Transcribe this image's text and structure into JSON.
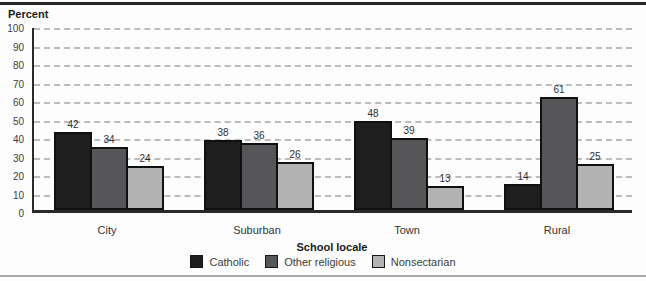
{
  "figure": {
    "y_axis_title": "Percent",
    "x_axis_title": "School locale"
  },
  "chart_data": {
    "type": "bar",
    "title": "",
    "ylabel": "Percent",
    "xlabel": "School locale",
    "categories": [
      "City",
      "Suburban",
      "Town",
      "Rural"
    ],
    "series": [
      {
        "name": "Catholic",
        "color": "#1e1e1e",
        "values": [
          42,
          38,
          48,
          14
        ]
      },
      {
        "name": "Other religious",
        "color": "#565658",
        "values": [
          34,
          36,
          39,
          61
        ]
      },
      {
        "name": "Nonsectarian",
        "color": "#b3b3b3",
        "values": [
          24,
          26,
          13,
          25
        ]
      }
    ],
    "ylim": [
      0,
      100
    ],
    "ytick_interval": 10,
    "ytick_labels": [
      "0",
      "10",
      "20",
      "30",
      "40",
      "50",
      "60",
      "70",
      "80",
      "90",
      "100"
    ],
    "grid": "horizontal-dashed",
    "legend_position": "bottom",
    "value_labels_shown": true
  },
  "colors": {
    "top_rule": "#262626",
    "bottom_rule": "#a8a8a8",
    "axis": "#2a2a2a",
    "gridline": "#bcbcbc",
    "bar_outline": "#101010",
    "background": "#fdfdfd"
  }
}
